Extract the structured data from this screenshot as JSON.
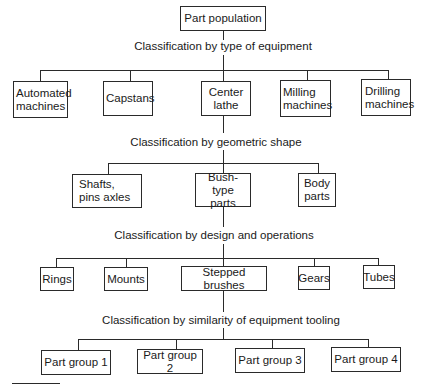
{
  "diagram": {
    "root": {
      "label": "Part population"
    },
    "levels": [
      {
        "classification": "Classification by type of equipment",
        "nodes": [
          {
            "label": "Automated machines"
          },
          {
            "label": "Capstans"
          },
          {
            "label": "Center lathe"
          },
          {
            "label": "Milling machines"
          },
          {
            "label": "Drilling machines"
          }
        ],
        "expanded_node": "Center lathe"
      },
      {
        "classification": "Classification by geometric shape",
        "nodes": [
          {
            "label": "Shafts, pins axles"
          },
          {
            "label": "Bush-type parts"
          },
          {
            "label": "Body parts"
          }
        ],
        "expanded_node": "Bush-type parts"
      },
      {
        "classification": "Classification by design and operations",
        "nodes": [
          {
            "label": "Rings"
          },
          {
            "label": "Mounts"
          },
          {
            "label": "Stepped brushes"
          },
          {
            "label": "Gears"
          },
          {
            "label": "Tubes"
          }
        ],
        "expanded_node": "Stepped brushes"
      },
      {
        "classification": "Classification by similarity of equipment tooling",
        "nodes": [
          {
            "label": "Part group 1"
          },
          {
            "label": "Part group 2"
          },
          {
            "label": "Part group 3"
          },
          {
            "label": "Part group 4"
          }
        ]
      }
    ]
  }
}
